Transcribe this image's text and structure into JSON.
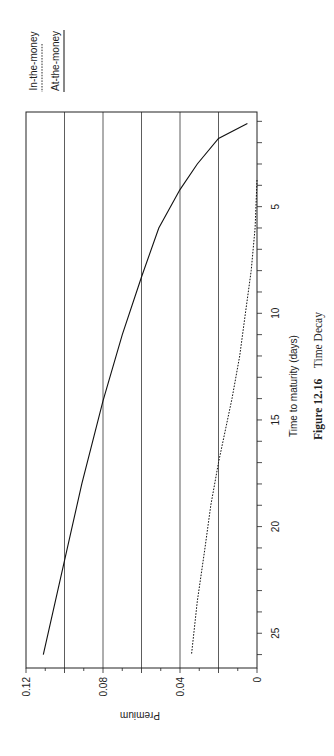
{
  "chart_data": {
    "type": "line",
    "title": "Time Decay",
    "caption": {
      "figure_label": "Figure 12.16",
      "title": "Time Decay"
    },
    "xlabel": "Time to maturity (days)",
    "ylabel": "Premium",
    "orientation": "rotated 90° (page in landscape)",
    "xlim": [
      0.5,
      26.6
    ],
    "ylim": [
      0,
      0.12
    ],
    "x_ticks": [
      5,
      10,
      15,
      20,
      25
    ],
    "x_minor_ticks_every": 1,
    "y_ticks": [
      "0",
      "0.04",
      "0.08",
      "0.12"
    ],
    "y_gridlines": [
      0.02,
      0.04,
      0.06,
      0.08,
      0.1
    ],
    "grid": true,
    "legend_position": "top-left (rotated)",
    "legend": [
      {
        "label": "In-the-money",
        "style": "dotted"
      },
      {
        "label": "At-the-money",
        "style": "solid"
      }
    ],
    "series": [
      {
        "name": "At-the-money",
        "style": "solid",
        "x": [
          1.1,
          1.8,
          3.0,
          4.2,
          6.0,
          8.3,
          11.0,
          14.1,
          18.0,
          21.6,
          26.0
        ],
        "values": [
          0.005,
          0.02,
          0.031,
          0.04,
          0.051,
          0.06,
          0.07,
          0.08,
          0.091,
          0.1,
          0.111
        ]
      },
      {
        "name": "In-the-money",
        "style": "dotted",
        "x": [
          3.75,
          6.0,
          8.0,
          10.0,
          12.0,
          14.0,
          17.0,
          19.0,
          21.0,
          23.5,
          26.0
        ],
        "values": [
          0.0,
          0.001,
          0.003,
          0.006,
          0.009,
          0.013,
          0.02,
          0.024,
          0.027,
          0.031,
          0.034
        ]
      }
    ]
  }
}
